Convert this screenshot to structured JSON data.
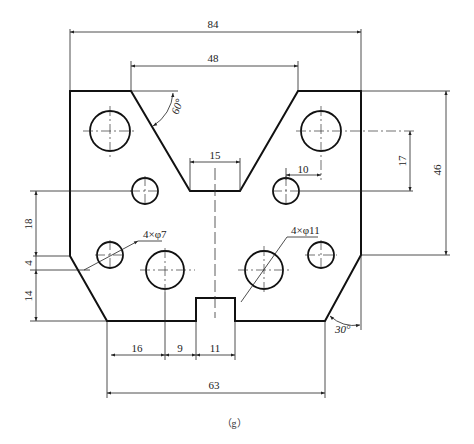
{
  "figure": {
    "caption": "（g）"
  },
  "dimensions": {
    "overall_width": "84",
    "v_top_width": "48",
    "v_bottom_width": "15",
    "v_angle": "60°",
    "hole_offset_x": "10",
    "hole_offset_y": "17",
    "overall_height": "46",
    "left_18": "18",
    "left_4": "4",
    "left_14": "14",
    "bottom_16": "16",
    "bottom_9": "9",
    "slot_width": "11",
    "bottom_width": "63",
    "chamfer_angle": "30°",
    "small_holes": "4×φ7",
    "large_holes": "4×φ11"
  },
  "colors": {
    "line": "#111111",
    "background": "#ffffff"
  }
}
